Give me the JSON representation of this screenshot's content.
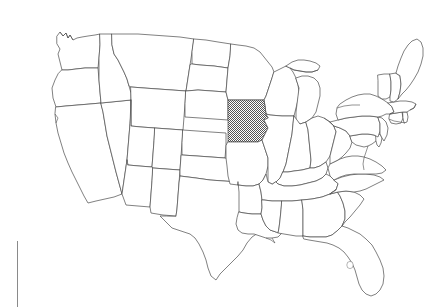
{
  "figure": {
    "title": "Map of the contiguous United States",
    "subtitle": "State outline map with one state shaded",
    "background_color": "#ffffff",
    "width": 428,
    "height": 307
  },
  "map": {
    "name": "united-states-state-outline-map",
    "projection_note": "contiguous 48 states",
    "outline_color": "#4a4a4a",
    "fill_color": "#ffffff",
    "highlight_color": "#8a8a8a",
    "highlight_pattern": "dithered-gray-halftone",
    "highlighted_states": [
      "Iowa"
    ],
    "highlighted_state_label": "Iowa",
    "states": [
      {
        "code": "WA",
        "name": "Washington",
        "highlighted": false
      },
      {
        "code": "OR",
        "name": "Oregon",
        "highlighted": false
      },
      {
        "code": "CA",
        "name": "California",
        "highlighted": false
      },
      {
        "code": "NV",
        "name": "Nevada",
        "highlighted": false
      },
      {
        "code": "ID",
        "name": "Idaho",
        "highlighted": false
      },
      {
        "code": "MT",
        "name": "Montana",
        "highlighted": false
      },
      {
        "code": "WY",
        "name": "Wyoming",
        "highlighted": false
      },
      {
        "code": "UT",
        "name": "Utah",
        "highlighted": false
      },
      {
        "code": "AZ",
        "name": "Arizona",
        "highlighted": false
      },
      {
        "code": "CO",
        "name": "Colorado",
        "highlighted": false
      },
      {
        "code": "NM",
        "name": "New Mexico",
        "highlighted": false
      },
      {
        "code": "ND",
        "name": "North Dakota",
        "highlighted": false
      },
      {
        "code": "SD",
        "name": "South Dakota",
        "highlighted": false
      },
      {
        "code": "NE",
        "name": "Nebraska",
        "highlighted": false
      },
      {
        "code": "KS",
        "name": "Kansas",
        "highlighted": false
      },
      {
        "code": "OK",
        "name": "Oklahoma",
        "highlighted": false
      },
      {
        "code": "TX",
        "name": "Texas",
        "highlighted": false
      },
      {
        "code": "MN",
        "name": "Minnesota",
        "highlighted": false
      },
      {
        "code": "IA",
        "name": "Iowa",
        "highlighted": true
      },
      {
        "code": "MO",
        "name": "Missouri",
        "highlighted": false
      },
      {
        "code": "AR",
        "name": "Arkansas",
        "highlighted": false
      },
      {
        "code": "LA",
        "name": "Louisiana",
        "highlighted": false
      },
      {
        "code": "WI",
        "name": "Wisconsin",
        "highlighted": false
      },
      {
        "code": "IL",
        "name": "Illinois",
        "highlighted": false
      },
      {
        "code": "MI",
        "name": "Michigan",
        "highlighted": false
      },
      {
        "code": "IN",
        "name": "Indiana",
        "highlighted": false
      },
      {
        "code": "OH",
        "name": "Ohio",
        "highlighted": false
      },
      {
        "code": "KY",
        "name": "Kentucky",
        "highlighted": false
      },
      {
        "code": "TN",
        "name": "Tennessee",
        "highlighted": false
      },
      {
        "code": "MS",
        "name": "Mississippi",
        "highlighted": false
      },
      {
        "code": "AL",
        "name": "Alabama",
        "highlighted": false
      },
      {
        "code": "GA",
        "name": "Georgia",
        "highlighted": false
      },
      {
        "code": "FL",
        "name": "Florida",
        "highlighted": false
      },
      {
        "code": "SC",
        "name": "South Carolina",
        "highlighted": false
      },
      {
        "code": "NC",
        "name": "North Carolina",
        "highlighted": false
      },
      {
        "code": "VA",
        "name": "Virginia",
        "highlighted": false
      },
      {
        "code": "WV",
        "name": "West Virginia",
        "highlighted": false
      },
      {
        "code": "MD",
        "name": "Maryland",
        "highlighted": false
      },
      {
        "code": "DE",
        "name": "Delaware",
        "highlighted": false
      },
      {
        "code": "PA",
        "name": "Pennsylvania",
        "highlighted": false
      },
      {
        "code": "NJ",
        "name": "New Jersey",
        "highlighted": false
      },
      {
        "code": "NY",
        "name": "New York",
        "highlighted": false
      },
      {
        "code": "CT",
        "name": "Connecticut",
        "highlighted": false
      },
      {
        "code": "RI",
        "name": "Rhode Island",
        "highlighted": false
      },
      {
        "code": "MA",
        "name": "Massachusetts",
        "highlighted": false
      },
      {
        "code": "VT",
        "name": "Vermont",
        "highlighted": false
      },
      {
        "code": "NH",
        "name": "New Hampshire",
        "highlighted": false
      },
      {
        "code": "ME",
        "name": "Maine",
        "highlighted": false
      }
    ]
  },
  "artifacts": {
    "margin_rule": {
      "name": "vertical-rule-artifact",
      "color": "#8a8a8a",
      "x": 17,
      "y": 241,
      "width": 1,
      "height": 66
    }
  }
}
